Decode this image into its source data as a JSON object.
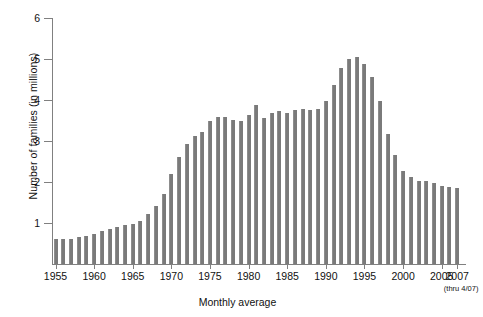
{
  "chart_data": {
    "type": "bar",
    "title": "",
    "xlabel": "Monthly average",
    "ylabel": "Number of families (in millions)",
    "xlabel_note": "(thru 4/07)",
    "ylim": [
      0,
      6
    ],
    "y_ticks": [
      0,
      1,
      2,
      3,
      4,
      5,
      6
    ],
    "y_tick_labels": [
      "",
      "1",
      "2",
      "3",
      "4",
      "5",
      "6"
    ],
    "x_tick_labels": [
      "1955",
      "1960",
      "1965",
      "1970",
      "1975",
      "1980",
      "1985",
      "1990",
      "1995",
      "2000",
      "2005",
      "2007"
    ],
    "grid": false,
    "legend": false,
    "bar_color": "#7a7a7a",
    "axis_color": "#808080",
    "categories": [
      "1955",
      "1956",
      "1957",
      "1958",
      "1959",
      "1960",
      "1961",
      "1962",
      "1963",
      "1964",
      "1965",
      "1966",
      "1967",
      "1968",
      "1969",
      "1970",
      "1971",
      "1972",
      "1973",
      "1974",
      "1975",
      "1976",
      "1977",
      "1978",
      "1979",
      "1980",
      "1981",
      "1982",
      "1983",
      "1984",
      "1985",
      "1986",
      "1987",
      "1988",
      "1989",
      "1990",
      "1991",
      "1992",
      "1993",
      "1994",
      "1995",
      "1996",
      "1997",
      "1998",
      "1999",
      "2000",
      "2001",
      "2002",
      "2003",
      "2004",
      "2005",
      "2006",
      "2007"
    ],
    "values": [
      0.6,
      0.6,
      0.62,
      0.67,
      0.68,
      0.74,
      0.8,
      0.85,
      0.9,
      0.94,
      0.98,
      1.05,
      1.22,
      1.42,
      1.7,
      2.2,
      2.6,
      2.92,
      3.12,
      3.22,
      3.5,
      3.58,
      3.58,
      3.52,
      3.5,
      3.64,
      3.88,
      3.57,
      3.69,
      3.73,
      3.69,
      3.75,
      3.78,
      3.75,
      3.77,
      3.97,
      4.37,
      4.77,
      5.0,
      5.05,
      4.87,
      4.55,
      3.98,
      3.18,
      2.65,
      2.27,
      2.12,
      2.03,
      2.03,
      1.98,
      1.9,
      1.88,
      1.85
    ]
  }
}
